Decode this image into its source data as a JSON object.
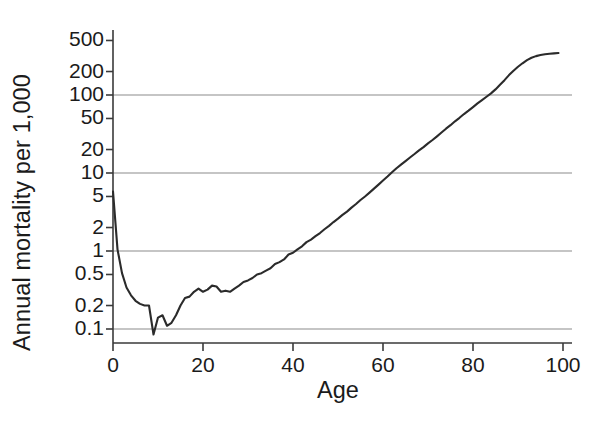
{
  "chart_data": {
    "type": "line",
    "title": "",
    "xlabel": "Age",
    "ylabel": "Annual mortality per 1,000",
    "yscale": "log",
    "xscale": "linear",
    "xlim": [
      0,
      100
    ],
    "ylim": [
      0.07,
      600
    ],
    "grid": "horizontal gridlines at 0.1, 1, 10, 100",
    "gridline_values": [
      0.1,
      1,
      10,
      100
    ],
    "ytick_values": [
      0.1,
      0.2,
      0.5,
      1,
      2,
      5,
      10,
      20,
      50,
      100,
      200,
      500
    ],
    "ytick_labels": [
      "0.1",
      "0.2",
      "0.5",
      "1",
      "2",
      "5",
      "10",
      "20",
      "50",
      "100",
      "200",
      "500"
    ],
    "xtick_values": [
      0,
      20,
      40,
      60,
      80,
      100
    ],
    "xtick_labels": [
      "0",
      "20",
      "40",
      "60",
      "80",
      "100"
    ],
    "legend": null,
    "series": [
      {
        "name": "Annual mortality per 1,000",
        "color": "#2b2b2b",
        "x": [
          0,
          1,
          2,
          3,
          4,
          5,
          6,
          7,
          8,
          9,
          10,
          11,
          12,
          13,
          14,
          15,
          16,
          17,
          18,
          19,
          20,
          21,
          22,
          23,
          24,
          25,
          26,
          27,
          28,
          29,
          30,
          31,
          32,
          33,
          34,
          35,
          36,
          37,
          38,
          39,
          40,
          41,
          42,
          43,
          44,
          45,
          46,
          47,
          48,
          49,
          50,
          51,
          52,
          53,
          54,
          55,
          56,
          57,
          58,
          59,
          60,
          61,
          62,
          63,
          64,
          65,
          66,
          67,
          68,
          69,
          70,
          71,
          72,
          73,
          74,
          75,
          76,
          77,
          78,
          79,
          80,
          81,
          82,
          83,
          84,
          85,
          86,
          87,
          88,
          89,
          90,
          91,
          92,
          93,
          94,
          95,
          96,
          97,
          98,
          99
        ],
        "y": [
          5.8,
          1.05,
          0.52,
          0.34,
          0.27,
          0.23,
          0.21,
          0.2,
          0.2,
          0.085,
          0.14,
          0.15,
          0.11,
          0.12,
          0.15,
          0.2,
          0.25,
          0.26,
          0.3,
          0.33,
          0.3,
          0.32,
          0.36,
          0.35,
          0.3,
          0.31,
          0.3,
          0.33,
          0.36,
          0.4,
          0.42,
          0.45,
          0.5,
          0.52,
          0.56,
          0.6,
          0.68,
          0.72,
          0.78,
          0.9,
          0.95,
          1.05,
          1.15,
          1.3,
          1.4,
          1.55,
          1.7,
          1.9,
          2.1,
          2.35,
          2.6,
          2.9,
          3.2,
          3.6,
          4.0,
          4.5,
          5.0,
          5.6,
          6.3,
          7.1,
          8.0,
          9.0,
          10.2,
          11.5,
          12.8,
          14.2,
          15.8,
          17.5,
          19.5,
          21.5,
          24.0,
          26.5,
          29.5,
          33.0,
          37.0,
          41.0,
          46.0,
          51.0,
          57.0,
          63.0,
          70.0,
          78.0,
          86.0,
          95.0,
          105.0,
          118.0,
          135.0,
          155.0,
          180.0,
          205.0,
          230.0,
          255.0,
          280.0,
          300.0,
          315.0,
          325.0,
          333.0,
          338.0,
          342.0,
          345.0
        ]
      }
    ]
  },
  "axes": {
    "y_title": "Annual mortality per 1,000",
    "x_title": "Age"
  }
}
